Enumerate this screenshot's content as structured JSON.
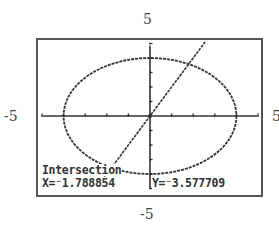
{
  "window": {
    "ymax_label": "5",
    "ymin_label": "-5",
    "xmin_label": "-5",
    "xmax_label": "5"
  },
  "readout": {
    "title": "Intersection",
    "x_text": "X=⁻1.788854",
    "y_text": "Y=⁻3.577709"
  },
  "colors": {
    "ink": "#333333",
    "background": "#ffffff"
  },
  "chart_data": {
    "type": "line",
    "title": "",
    "xlabel": "",
    "ylabel": "",
    "xlim": [
      -5,
      5
    ],
    "ylim": [
      -5,
      5
    ],
    "xscl": 1,
    "yscl": 1,
    "grid": false,
    "axes": true,
    "tick_labels": {
      "top": "5",
      "bottom": "-5",
      "left": "-5",
      "right": "5"
    },
    "series": [
      {
        "name": "circle",
        "equation": "x^2 + y^2 = 16",
        "style": "dotted-pixel",
        "radius": 4
      },
      {
        "name": "line",
        "equation": "y = 2x",
        "style": "dotted-pixel",
        "slope": 2,
        "intercept": 0
      }
    ],
    "annotation": {
      "label": "Intersection",
      "x": -1.788854,
      "y": -3.577709
    }
  }
}
